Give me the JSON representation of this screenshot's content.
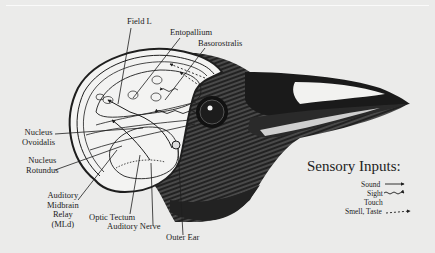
{
  "diagram": {
    "colors": {
      "background": "#ebebea",
      "ink": "#1e1e1e",
      "beak_highlight": "#f2f2f0"
    },
    "labels": {
      "field_l": "Field L",
      "entopallium": "Entopallium",
      "basorostralis": "Basorostralis",
      "nucleus_ovoidalis": [
        "Nucleus",
        "Ovoidalis"
      ],
      "nucleus_rotundus": [
        "Nucleus",
        "Rotundus"
      ],
      "auditory_midbrain_relay": [
        "Auditory",
        "Midbrain",
        "Relay",
        "(MLd)"
      ],
      "optic_tectum": "Optic Tectum",
      "auditory_nerve": "Auditory Nerve",
      "outer_ear": "Outer Ear"
    },
    "legend": {
      "title": "Sensory Inputs:",
      "items": [
        {
          "label": "Sound",
          "line_style": "solid-arrow"
        },
        {
          "label": "Sight",
          "line_style": "wavy-arrow"
        },
        {
          "label": "Touch",
          "line_style": "none"
        },
        {
          "label": "Smell, Taste",
          "line_style": "dashed-arrow"
        }
      ]
    }
  }
}
